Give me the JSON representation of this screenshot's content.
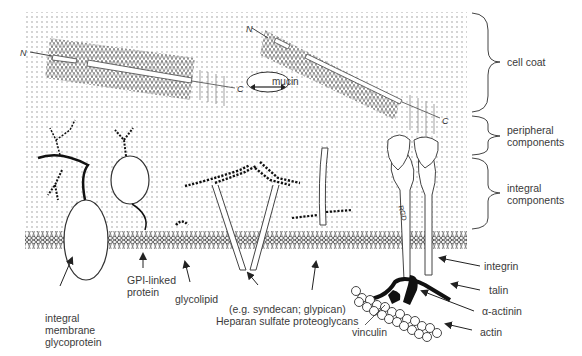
{
  "diagram": {
    "type": "cell-surface-schematic",
    "brackets": [
      {
        "id": "cell-coat",
        "label": "cell coat"
      },
      {
        "id": "peripheral",
        "label_line1": "peripheral",
        "label_line2": "components"
      },
      {
        "id": "integral",
        "label_line1": "integral",
        "label_line2": "components"
      }
    ],
    "mucin": {
      "label": "mucin",
      "terminal_n": "N",
      "terminal_c": "C"
    },
    "integrin_motif": "RGD",
    "labels": {
      "integral_glycoprotein": {
        "line1": "integral",
        "line2": "membrane",
        "line3": "glycoprotein"
      },
      "gpi_protein": {
        "line1": "GPI-linked",
        "line2": "protein"
      },
      "glycolipid": "glycolipid",
      "proteoglycans": {
        "line1": "(e.g. syndecan; glypican)",
        "line2": "Heparan sulfate proteoglycans"
      },
      "vinculin": "vinculin",
      "integrin": "integrin",
      "talin": "talin",
      "alpha_actinin": "α-actinin",
      "actin": "actin"
    },
    "colors": {
      "background": "#ffffff",
      "dots": "#8a8a8a",
      "ink": "#222222",
      "label_text": "#3a3a3a"
    }
  }
}
